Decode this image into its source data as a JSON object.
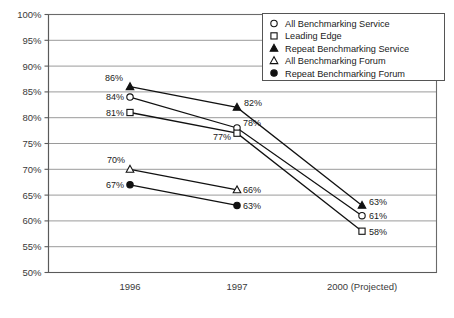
{
  "chart_data": {
    "type": "line",
    "title": "",
    "xlabel": "",
    "ylabel": "",
    "categories": [
      "1996",
      "1997",
      "2000 (Projected)"
    ],
    "ylim": [
      50,
      100
    ],
    "ytick_labels": [
      "100%",
      "95%",
      "90%",
      "85%",
      "80%",
      "75%",
      "70%",
      "65%",
      "60%",
      "55%",
      "50%"
    ],
    "ytick_values": [
      100,
      95,
      90,
      85,
      80,
      75,
      70,
      65,
      60,
      55,
      50
    ],
    "grid": true,
    "legend_position": "top-right",
    "series": [
      {
        "name": "All Benchmarking Service",
        "marker": "open-circle",
        "values": [
          84,
          78,
          61
        ],
        "labels": [
          "84%",
          "78%",
          "61%"
        ]
      },
      {
        "name": "Leading Edge",
        "marker": "open-square",
        "values": [
          81,
          77,
          58
        ],
        "labels": [
          "81%",
          "77%",
          "58%"
        ]
      },
      {
        "name": "Repeat Benchmarking Service",
        "marker": "filled-triangle",
        "values": [
          86,
          82,
          63
        ],
        "labels": [
          "86%",
          "82%",
          "63%"
        ]
      },
      {
        "name": "All Benchmarking Forum",
        "marker": "open-triangle",
        "values": [
          70,
          66,
          null
        ],
        "labels": [
          "70%",
          "66%",
          null
        ]
      },
      {
        "name": "Repeat Benchmarking Forum",
        "marker": "filled-circle",
        "values": [
          67,
          63,
          null
        ],
        "labels": [
          "67%",
          "63%",
          null
        ]
      }
    ]
  },
  "colors": {
    "line": "#111111",
    "grid": "#8e8e8e",
    "axis": "#5a5a5a",
    "text": "#1a1a1a",
    "background": "#ffffff"
  }
}
